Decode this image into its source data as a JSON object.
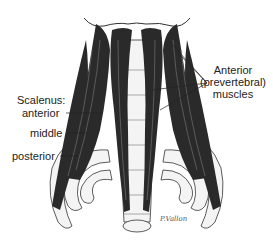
{
  "figure": {
    "labels": {
      "anterior_prevertebral": [
        "Anterior",
        "(prevertebral)",
        "muscles"
      ],
      "scalenus_title": "Scalenus:",
      "scalenus_anterior": "anterior",
      "scalenus_middle": "middle",
      "scalenus_posterior": "posterior"
    },
    "signature": "P.Vallon",
    "colors": {
      "muscle": "#2a2a2a",
      "muscle_stripe": "#8a8a8a",
      "bone": "#f4f4f4",
      "outline": "#333333",
      "leader": "#222222"
    }
  }
}
